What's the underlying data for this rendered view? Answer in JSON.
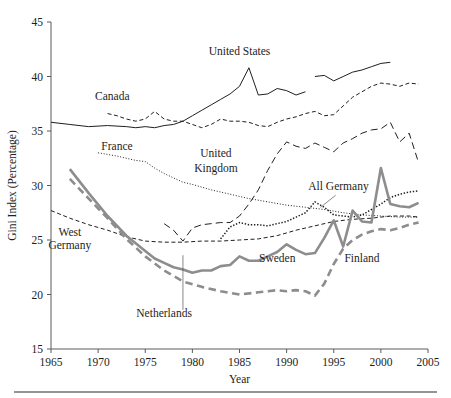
{
  "chart_data": {
    "type": "line",
    "title": "",
    "xlabel": "Year",
    "ylabel": "Gini Index (Percentage)",
    "xlim": [
      1965,
      2005
    ],
    "ylim": [
      15,
      45
    ],
    "xticks": [
      1965,
      1970,
      1975,
      1980,
      1985,
      1990,
      1995,
      2000,
      2005
    ],
    "yticks": [
      15,
      20,
      25,
      30,
      35,
      40,
      45
    ],
    "grid": false,
    "legend_position": "inline-annotations",
    "colors": {
      "dark": "#1f1f1f",
      "gray": "#8d8d8d",
      "axis": "#5a5a5a"
    },
    "series": [
      {
        "name": "United States",
        "style": "solid-thin-dark",
        "color": "#1f1f1f",
        "label": "United States",
        "label_x": 1985.0,
        "label_y": 42.0,
        "segments": [
          {
            "x": [
              1965,
              1967,
              1969,
              1971,
              1973,
              1974,
              1975,
              1976,
              1977,
              1978,
              1979,
              1980,
              1981,
              1982,
              1983,
              1984,
              1985,
              1986,
              1987,
              1988,
              1989,
              1990,
              1991,
              1992
            ],
            "y": [
              35.8,
              35.6,
              35.4,
              35.5,
              35.4,
              35.3,
              35.4,
              35.3,
              35.5,
              35.6,
              35.9,
              36.4,
              36.9,
              37.4,
              37.9,
              38.4,
              39.1,
              40.8,
              38.3,
              38.4,
              38.9,
              38.7,
              38.3,
              38.6
            ]
          },
          {
            "x": [
              1993,
              1994,
              1995,
              1996,
              1997,
              1998,
              1999,
              2000,
              2001
            ],
            "y": [
              40.0,
              40.1,
              39.6,
              40.0,
              40.4,
              40.6,
              40.9,
              41.2,
              41.3
            ]
          }
        ]
      },
      {
        "name": "Canada",
        "style": "dashed-short-dark",
        "color": "#1f1f1f",
        "label": "Canada",
        "label_x": 1971.5,
        "label_y": 37.8,
        "segments": [
          {
            "x": [
              1971,
              1972,
              1973,
              1974,
              1975,
              1976,
              1977,
              1978,
              1979,
              1980,
              1981,
              1982,
              1983,
              1984,
              1985,
              1986,
              1987,
              1988,
              1989,
              1990,
              1991,
              1992,
              1993,
              1994,
              1995,
              1996,
              1997,
              1998,
              1999,
              2000,
              2001,
              2002,
              2003,
              2004
            ],
            "y": [
              36.6,
              36.4,
              36.1,
              35.9,
              36.1,
              36.8,
              36.1,
              35.9,
              35.9,
              35.6,
              35.3,
              35.6,
              36.1,
              35.9,
              35.9,
              35.8,
              35.5,
              35.4,
              35.8,
              36.1,
              36.3,
              36.6,
              36.8,
              36.4,
              36.5,
              37.3,
              38.1,
              38.6,
              39.1,
              39.4,
              39.3,
              39.1,
              39.4,
              39.3
            ]
          }
        ]
      },
      {
        "name": "France",
        "style": "dotted-fine-dark",
        "color": "#1f1f1f",
        "label": "France",
        "label_x": 1972.0,
        "label_y": 33.3,
        "segments": [
          {
            "x": [
              1970,
              1972,
              1974,
              1975,
              1976,
              1977,
              1978,
              1979,
              1980,
              1982,
              1984,
              1986,
              1988,
              1990,
              1992,
              1994,
              1996,
              1998,
              2000,
              2002,
              2004
            ],
            "y": [
              33.0,
              32.7,
              32.3,
              32.2,
              31.6,
              31.1,
              30.7,
              30.3,
              30.1,
              29.6,
              29.2,
              28.8,
              28.5,
              28.2,
              28.0,
              27.8,
              27.5,
              27.3,
              27.2,
              27.1,
              27.1
            ]
          }
        ]
      },
      {
        "name": "United Kingdom",
        "style": "dashed-long-dark",
        "color": "#1f1f1f",
        "label": "United Kingdom",
        "label_x": 1982.5,
        "label_y": 32.2,
        "segments": [
          {
            "x": [
              1977,
              1978,
              1979,
              1980,
              1981,
              1982,
              1983,
              1984,
              1985,
              1986,
              1987,
              1988,
              1989,
              1990,
              1991,
              1992,
              1993,
              1994,
              1995,
              1996,
              1997,
              1998,
              1999,
              2000,
              2001,
              2002,
              2003,
              2004
            ],
            "y": [
              26.5,
              25.9,
              24.9,
              26.1,
              26.4,
              26.5,
              26.6,
              26.6,
              27.2,
              28.3,
              29.6,
              31.4,
              32.9,
              34.0,
              33.6,
              33.4,
              33.9,
              33.5,
              33.1,
              33.9,
              34.3,
              34.8,
              35.1,
              35.2,
              35.8,
              34.0,
              34.8,
              32.1
            ]
          }
        ]
      },
      {
        "name": "West Germany",
        "style": "dashed-short-dark",
        "color": "#1f1f1f",
        "label": "West Germany",
        "label_x": 1967.0,
        "label_y": 24.9,
        "segments": [
          {
            "x": [
              1965,
              1967,
              1969,
              1971,
              1973,
              1975,
              1977,
              1979,
              1981,
              1983,
              1985,
              1987,
              1989,
              1991,
              1993,
              1995,
              1997,
              1999,
              2001,
              2003,
              2004
            ],
            "y": [
              27.7,
              27.0,
              26.4,
              25.9,
              25.3,
              24.9,
              24.8,
              24.8,
              24.9,
              24.9,
              25.0,
              25.1,
              25.4,
              25.9,
              26.3,
              26.7,
              26.9,
              27.0,
              27.2,
              27.2,
              27.1
            ]
          }
        ]
      },
      {
        "name": "All Germany",
        "style": "dotted-bold-dark",
        "color": "#1f1f1f",
        "label": "All Germany",
        "label_x": 1995.5,
        "label_y": 29.6,
        "leader": {
          "x1": 1995.2,
          "y1": 29.1,
          "x2": 1993.6,
          "y2": 28.0
        },
        "segments": [
          {
            "x": [
              1983,
              1984,
              1985,
              1986,
              1987,
              1988,
              1989,
              1990,
              1991,
              1992,
              1993,
              1994,
              1995,
              1996,
              1997,
              1998,
              1999,
              2000,
              2001,
              2002,
              2003,
              2004
            ],
            "y": [
              25.1,
              26.2,
              26.6,
              26.4,
              26.4,
              26.3,
              26.5,
              26.7,
              27.1,
              27.5,
              28.5,
              28.0,
              27.3,
              27.2,
              27.1,
              27.3,
              27.8,
              28.3,
              28.9,
              29.2,
              29.4,
              29.5
            ]
          }
        ]
      },
      {
        "name": "Sweden",
        "style": "solid-thick-gray",
        "color": "#8d8d8d",
        "label": "Sweden",
        "label_x": 1989.0,
        "label_y": 23.0,
        "segments": [
          {
            "x": [
              1967,
              1969,
              1971,
              1973,
              1975,
              1976,
              1977,
              1978,
              1979,
              1980,
              1981,
              1982,
              1983,
              1984,
              1985,
              1986,
              1987,
              1988,
              1989,
              1990,
              1991,
              1992,
              1993,
              1994,
              1995,
              1996,
              1997,
              1998,
              1999,
              2000,
              2001,
              2002,
              2003,
              2004
            ],
            "y": [
              31.5,
              29.3,
              27.2,
              25.4,
              24.0,
              23.3,
              22.9,
              22.5,
              22.3,
              22.0,
              22.2,
              22.2,
              22.6,
              22.7,
              23.5,
              23.1,
              23.1,
              23.5,
              23.9,
              24.6,
              24.1,
              23.7,
              23.8,
              25.2,
              26.8,
              24.4,
              27.7,
              26.7,
              26.6,
              31.6,
              28.3,
              28.1,
              28.0,
              28.4
            ]
          }
        ]
      },
      {
        "name": "Netherlands",
        "style": "dashed-thick-gray",
        "color": "#8d8d8d",
        "label": "Netherlands",
        "label_x": 1977.0,
        "label_y": 17.9,
        "leader": {
          "x1": 1979.0,
          "y1": 18.6,
          "x2": 1979.0,
          "y2": 23.6
        },
        "segments": [
          {
            "x": [
              1967,
              1969,
              1971,
              1973,
              1975,
              1977,
              1979,
              1981,
              1983,
              1985,
              1987,
              1989,
              1990,
              1991,
              1992,
              1993,
              1994,
              1995,
              1996,
              1997,
              1998,
              1999,
              2000,
              2001,
              2002,
              2003,
              2004
            ],
            "y": [
              30.6,
              28.8,
              27.0,
              25.1,
              23.5,
              22.2,
              21.2,
              20.7,
              20.3,
              20.0,
              20.2,
              20.4,
              20.3,
              20.4,
              20.3,
              19.9,
              21.0,
              22.8,
              24.2,
              25.0,
              25.5,
              25.8,
              26.0,
              25.9,
              26.1,
              26.4,
              26.6
            ]
          }
        ]
      },
      {
        "name": "Finland",
        "style": "dashed-thick-gray",
        "color": "#8d8d8d",
        "label": "Finland",
        "label_x": 1998.0,
        "label_y": 23.0,
        "segments": []
      }
    ],
    "annotations": [
      {
        "text": "United States",
        "x": 1985.0,
        "y": 42.0
      },
      {
        "text": "Canada",
        "x": 1971.5,
        "y": 37.8
      },
      {
        "text": "France",
        "x": 1972.0,
        "y": 33.3
      },
      {
        "text": "United",
        "x": 1982.5,
        "y": 32.6
      },
      {
        "text": "Kingdom",
        "x": 1982.5,
        "y": 31.2
      },
      {
        "text": "All Germany",
        "x": 1995.5,
        "y": 29.6
      },
      {
        "text": "West",
        "x": 1967.0,
        "y": 25.4
      },
      {
        "text": "Germany",
        "x": 1967.0,
        "y": 24.2
      },
      {
        "text": "Sweden",
        "x": 1989.0,
        "y": 23.0
      },
      {
        "text": "Finland",
        "x": 1998.0,
        "y": 23.0
      },
      {
        "text": "Netherlands",
        "x": 1977.0,
        "y": 17.9
      }
    ]
  },
  "axes": {
    "y_label": "Gini Index (Percentage)",
    "x_label": "Year",
    "y_ticks": [
      "45",
      "40",
      "35",
      "30",
      "25",
      "20",
      "15"
    ],
    "x_ticks": [
      "1965",
      "1970",
      "1975",
      "1980",
      "1985",
      "1990",
      "1995",
      "2000",
      "2005"
    ]
  },
  "labels": {
    "united_states": "United States",
    "canada": "Canada",
    "france": "France",
    "united_kingdom_1": "United",
    "united_kingdom_2": "Kingdom",
    "all_germany": "All Germany",
    "west_germany_1": "West",
    "west_germany_2": "Germany",
    "sweden": "Sweden",
    "finland": "Finland",
    "netherlands": "Netherlands"
  }
}
